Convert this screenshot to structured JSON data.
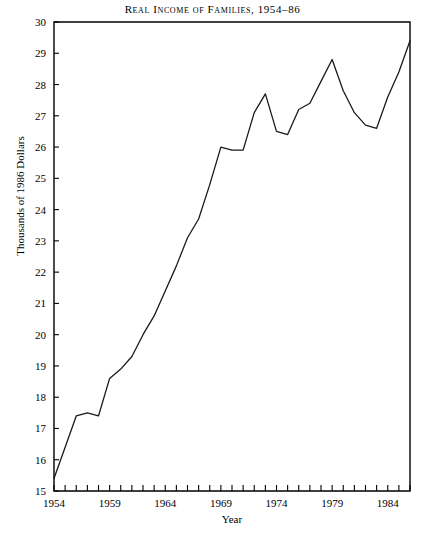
{
  "chart_data": {
    "type": "line",
    "title": "Real Income of Families, 1954–86",
    "xlabel": "Year",
    "ylabel": "Thousands of 1986 Dollars",
    "xlim": [
      1954,
      1986
    ],
    "ylim": [
      15,
      30
    ],
    "grid": false,
    "legend": "none",
    "x_tick_labels": [
      "1954",
      "1959",
      "1964",
      "1969",
      "1974",
      "1979",
      "1984"
    ],
    "x_tick_values": [
      1954,
      1959,
      1964,
      1969,
      1974,
      1979,
      1984
    ],
    "x_minor_tick_interval": 1,
    "y_tick_labels": [
      "15",
      "16",
      "17",
      "18",
      "19",
      "20",
      "21",
      "22",
      "23",
      "24",
      "25",
      "26",
      "27",
      "28",
      "29",
      "30"
    ],
    "y_tick_values": [
      15,
      16,
      17,
      18,
      19,
      20,
      21,
      22,
      23,
      24,
      25,
      26,
      27,
      28,
      29,
      30
    ],
    "line_color": "#1a1a1a",
    "x": [
      1954,
      1955,
      1956,
      1957,
      1958,
      1959,
      1960,
      1961,
      1962,
      1963,
      1964,
      1965,
      1966,
      1967,
      1968,
      1969,
      1970,
      1971,
      1972,
      1973,
      1974,
      1975,
      1976,
      1977,
      1978,
      1979,
      1980,
      1981,
      1982,
      1983,
      1984,
      1985,
      1986
    ],
    "values": [
      15.4,
      16.4,
      17.4,
      17.5,
      17.4,
      18.6,
      18.9,
      19.3,
      20.0,
      20.6,
      21.4,
      22.2,
      23.1,
      23.7,
      24.8,
      26.0,
      25.9,
      25.9,
      27.1,
      27.7,
      26.5,
      26.4,
      27.2,
      27.4,
      28.1,
      28.8,
      27.8,
      27.1,
      26.7,
      26.6,
      27.6,
      28.4,
      29.4
    ]
  }
}
